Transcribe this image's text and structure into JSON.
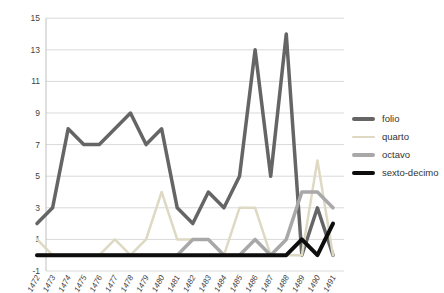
{
  "chart_data": {
    "type": "line",
    "title": "",
    "xlabel": "",
    "ylabel": "",
    "x": [
      "1472",
      "1473",
      "1474",
      "1475",
      "1476",
      "1477",
      "1478",
      "1479",
      "1480",
      "1481",
      "1482",
      "1483",
      "1484",
      "1485",
      "1486",
      "1487",
      "1488",
      "1489",
      "1490",
      "1491"
    ],
    "series": [
      {
        "name": "folio",
        "color": "#656565",
        "stroke_width": 3.5,
        "values": [
          2,
          3,
          8,
          7,
          7,
          8,
          9,
          7,
          8,
          3,
          2,
          4,
          3,
          5,
          13,
          5,
          14,
          0,
          3,
          0
        ]
      },
      {
        "name": "quarto",
        "color": "#ddd9c3",
        "stroke_width": 2.5,
        "values": [
          1,
          0,
          0,
          0,
          0,
          1,
          0,
          1,
          4,
          1,
          1,
          1,
          0,
          3,
          3,
          0,
          0,
          0,
          6,
          0
        ]
      },
      {
        "name": "octavo",
        "color": "#a8a8a8",
        "stroke_width": 3.5,
        "values": [
          0,
          0,
          0,
          0,
          0,
          0,
          0,
          0,
          0,
          0,
          1,
          1,
          0,
          0,
          1,
          0,
          1,
          4,
          4,
          3
        ]
      },
      {
        "name": "sexto-decimo",
        "color": "#0d0d0d",
        "stroke_width": 4,
        "values": [
          0,
          0,
          0,
          0,
          0,
          0,
          0,
          0,
          0,
          0,
          0,
          0,
          0,
          0,
          0,
          0,
          0,
          1,
          0,
          2
        ]
      }
    ],
    "y_axis": {
      "min": -1,
      "max": 15,
      "tick_step": 2,
      "ticks": [
        -1,
        1,
        3,
        5,
        7,
        9,
        11,
        13,
        15
      ]
    },
    "grid": "horizontal",
    "gridline_color": "#d9d9d9",
    "axis_line_color": "#c0c0c0",
    "legend_position": "right",
    "legend_labels": [
      "folio",
      "quarto",
      "octavo",
      "sexto-decimo"
    ]
  }
}
